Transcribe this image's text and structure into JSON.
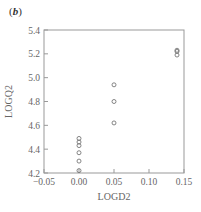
{
  "panel_label": "b",
  "chart_data": {
    "type": "scatter",
    "title": "",
    "xlabel": "LOGD2",
    "ylabel": "LOGQ2",
    "xlim": [
      -0.05,
      0.15
    ],
    "ylim": [
      4.2,
      5.4
    ],
    "xticks": [
      "-0.05",
      "0.00",
      "0.05",
      "0.10",
      "0.15"
    ],
    "yticks": [
      "4.2",
      "4.4",
      "4.6",
      "4.8",
      "5.0",
      "5.2",
      "5.4"
    ],
    "grid": false,
    "legend": null,
    "marker": "open-circle",
    "points": [
      {
        "x": 0.0,
        "y": 4.49
      },
      {
        "x": 0.0,
        "y": 4.46
      },
      {
        "x": 0.0,
        "y": 4.43
      },
      {
        "x": 0.0,
        "y": 4.37
      },
      {
        "x": 0.0,
        "y": 4.3
      },
      {
        "x": 0.0,
        "y": 4.22
      },
      {
        "x": 0.05,
        "y": 4.94
      },
      {
        "x": 0.05,
        "y": 4.8
      },
      {
        "x": 0.05,
        "y": 4.62
      },
      {
        "x": 0.14,
        "y": 5.23
      },
      {
        "x": 0.14,
        "y": 5.22
      },
      {
        "x": 0.14,
        "y": 5.19
      }
    ]
  }
}
